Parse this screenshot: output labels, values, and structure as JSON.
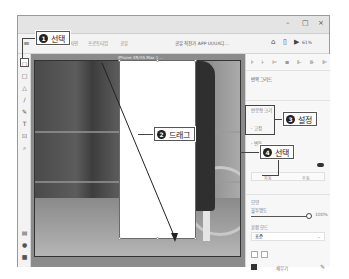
{
  "window": {
    "controls": {
      "minimize": "–",
      "maximize": "□",
      "close": "×"
    }
  },
  "appbar": {
    "menu_icon": "≡",
    "tabs": [
      {
        "label": "디자인"
      },
      {
        "label": "프로토타입"
      },
      {
        "label": "공유"
      }
    ],
    "document_title": "공유 직전가 APP UI/UX디...",
    "right_icons": [
      "⌂",
      "▯",
      "▶"
    ],
    "zoom_level": "61%"
  },
  "toolbar": {
    "tools": [
      {
        "name": "select-tool",
        "glyph": "▢",
        "selected": true
      },
      {
        "name": "rectangle-tool",
        "glyph": "□"
      },
      {
        "name": "triangle-tool",
        "glyph": "△"
      },
      {
        "name": "line-tool",
        "glyph": "/"
      },
      {
        "name": "pen-tool",
        "glyph": "✎"
      },
      {
        "name": "text-tool",
        "glyph": "T"
      },
      {
        "name": "artboard-tool",
        "glyph": "⊡"
      },
      {
        "name": "zoom-tool",
        "glyph": "⌕"
      }
    ],
    "bottom_tools": [
      {
        "name": "assets-icon",
        "glyph": "▤"
      },
      {
        "name": "layers-icon",
        "glyph": "●"
      },
      {
        "name": "plugins-icon",
        "glyph": "■"
      }
    ]
  },
  "canvas": {
    "artboard_label": "iPhone XR/XS Max 1 ..."
  },
  "panel": {
    "align_icons": "⊧ ⊦ ⊨ ≡ ⊩ ⊪ ⊫",
    "repeat_grid_label": "반복 그리드",
    "responsive_label": "반응형 크기",
    "fix_width_label": "- 고정",
    "fix_height_label": "- 변동",
    "toggle_label": "",
    "segment": [
      "자동",
      "수동"
    ],
    "appearance_label": "모양",
    "opacity_label": "불투명도",
    "opacity_value": "100%",
    "blend_label": "혼합 모드",
    "blend_value": "표준",
    "fill_label": "채우기"
  },
  "callouts": [
    {
      "num": "1",
      "label": "선택"
    },
    {
      "num": "2",
      "label": "드래그"
    },
    {
      "num": "3",
      "label": "설정"
    },
    {
      "num": "4",
      "label": "선택"
    }
  ]
}
